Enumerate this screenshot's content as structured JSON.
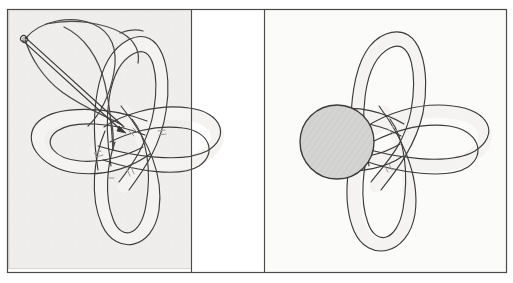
{
  "figure": {
    "kind": "scanned-book-illustration",
    "title": "",
    "page_background": "#ffffff",
    "outer_frame": {
      "name": "outer-frame",
      "x": 7,
      "y": 9,
      "width": 500,
      "height": 264,
      "stroke": "#4a4a4a",
      "stroke_width": 1.2,
      "fill": "#ffffff"
    },
    "divider_lines": [
      {
        "name": "divider-left",
        "x": 191.5,
        "y1": 10,
        "y2": 272,
        "stroke": "#4a4a4a"
      },
      {
        "name": "divider-right",
        "x": 264.5,
        "y1": 10,
        "y2": 272,
        "stroke": "#4a4a4a"
      }
    ],
    "panels": [
      {
        "id": "panel-left",
        "label": "",
        "x": 8,
        "y": 10,
        "width": 183,
        "height": 259,
        "background": "#efeeec",
        "contains": [
          "knot",
          "needle",
          "thread"
        ]
      },
      {
        "id": "panel-middle",
        "label": "",
        "x": 192,
        "y": 10,
        "width": 72,
        "height": 262,
        "background": "#ffffff",
        "contains": []
      },
      {
        "id": "panel-right",
        "label": "",
        "x": 265,
        "y": 10,
        "width": 242,
        "height": 262,
        "background": "#fbfbfa",
        "contains": [
          "knot",
          "bead"
        ]
      }
    ],
    "ink": {
      "line_stroke": "#3c3c3c",
      "line_stroke_light": "#5a5a5a",
      "cord_fill": "#f4f3f1",
      "cord_stroke": "#3b3b3b",
      "cord_width_px": 13,
      "bead_fill": "#d2d2d0",
      "bead_stroke": "#3a3a3a",
      "needle_stroke": "#3a3a3a",
      "thread_stroke": "#4a4a4a",
      "hatch_stroke": "#9a9a98"
    },
    "left_diagram": {
      "name": "knot-with-needle",
      "knot_center": {
        "x": 118,
        "y": 140
      },
      "loops": [
        {
          "name": "loop-top",
          "tip": {
            "x": 142,
            "y": 44
          },
          "angle_deg": -75
        },
        {
          "name": "loop-right",
          "tip": {
            "x": 215,
            "y": 132
          },
          "angle_deg": 10
        },
        {
          "name": "loop-bottom",
          "tip": {
            "x": 128,
            "y": 238
          },
          "angle_deg": 95
        },
        {
          "name": "loop-left",
          "tip": {
            "x": 38,
            "y": 142
          },
          "angle_deg": 188
        }
      ],
      "needle": {
        "name": "sewing-needle",
        "eye": {
          "x": 24,
          "y": 39
        },
        "tip": {
          "x": 124,
          "y": 128
        },
        "thickness_px": 3.4
      },
      "thread": {
        "name": "thread-loop",
        "note": "free thread loops up and over from the needle eye and re-enters the knot centre"
      },
      "crossing_marks": 5
    },
    "right_diagram": {
      "name": "knot-with-bead",
      "knot_center": {
        "x": 376,
        "y": 137
      },
      "loops": [
        {
          "name": "loop-top",
          "tip": {
            "x": 386,
            "y": 33
          },
          "angle_deg": -82
        },
        {
          "name": "loop-right",
          "tip": {
            "x": 487,
            "y": 130
          },
          "angle_deg": 5
        },
        {
          "name": "loop-bottom",
          "tip": {
            "x": 382,
            "y": 248
          },
          "angle_deg": 92
        },
        {
          "name": "loop-left-short",
          "tip": {
            "x": 330,
            "y": 140
          },
          "angle_deg": 182
        }
      ],
      "bead": {
        "name": "bead-ball",
        "cx": 337,
        "cy": 142,
        "r": 37,
        "fill": "#d2d2d0",
        "hatched": true
      }
    }
  }
}
